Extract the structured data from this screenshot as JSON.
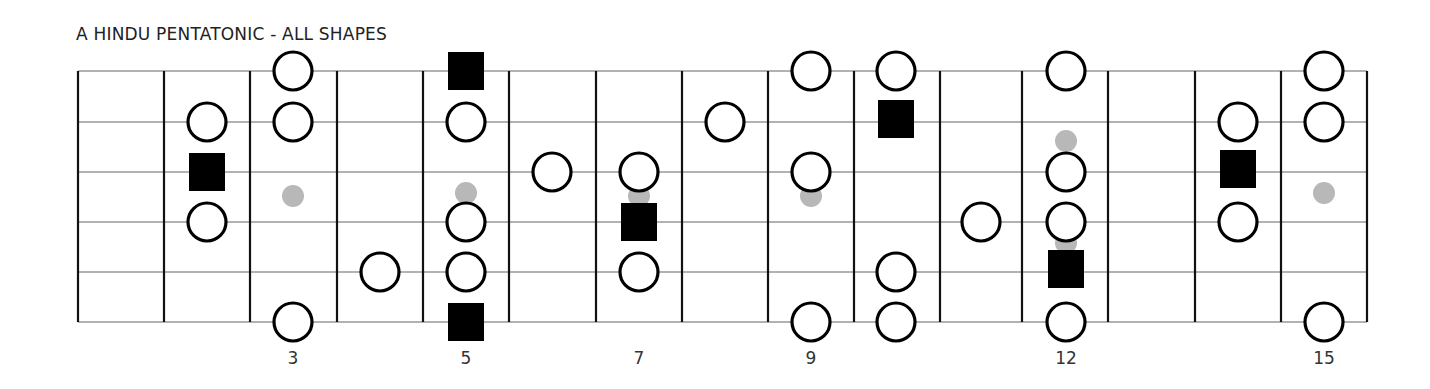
{
  "title": "A HINDU PENTATONIC - ALL SHAPES",
  "fretboard": {
    "fret_lines_x": [
      78,
      164,
      250,
      337,
      423,
      509,
      596,
      682,
      768,
      854,
      940,
      1022,
      1108,
      1195,
      1281,
      1367
    ],
    "strings_y": [
      71,
      122,
      172,
      222,
      272,
      322
    ],
    "string_color": "#999999",
    "fret_color": "#111111"
  },
  "fret_numbers": [
    {
      "label": "3",
      "x": 293
    },
    {
      "label": "5",
      "x": 466
    },
    {
      "label": "7",
      "x": 639
    },
    {
      "label": "9",
      "x": 811
    },
    {
      "label": "12",
      "x": 1066
    },
    {
      "label": "15",
      "x": 1324
    }
  ],
  "inlay_dots": [
    {
      "x": 293,
      "y": 196
    },
    {
      "x": 466,
      "y": 193
    },
    {
      "x": 639,
      "y": 196
    },
    {
      "x": 811,
      "y": 196
    },
    {
      "x": 1066,
      "y": 141
    },
    {
      "x": 1066,
      "y": 243
    },
    {
      "x": 1324,
      "y": 193
    }
  ],
  "notes": [
    {
      "type": "circle",
      "x": 207,
      "y": 122
    },
    {
      "type": "root",
      "x": 207,
      "y": 172
    },
    {
      "type": "circle",
      "x": 207,
      "y": 222
    },
    {
      "type": "circle",
      "x": 293,
      "y": 71
    },
    {
      "type": "circle",
      "x": 293,
      "y": 122
    },
    {
      "type": "circle",
      "x": 293,
      "y": 322
    },
    {
      "type": "circle",
      "x": 380,
      "y": 272
    },
    {
      "type": "root",
      "x": 466,
      "y": 71
    },
    {
      "type": "circle",
      "x": 466,
      "y": 122
    },
    {
      "type": "circle",
      "x": 466,
      "y": 222
    },
    {
      "type": "circle",
      "x": 466,
      "y": 272
    },
    {
      "type": "root",
      "x": 466,
      "y": 322
    },
    {
      "type": "circle",
      "x": 552,
      "y": 172
    },
    {
      "type": "circle",
      "x": 639,
      "y": 172
    },
    {
      "type": "root",
      "x": 639,
      "y": 222
    },
    {
      "type": "circle",
      "x": 639,
      "y": 272
    },
    {
      "type": "circle",
      "x": 725,
      "y": 122
    },
    {
      "type": "circle",
      "x": 811,
      "y": 71
    },
    {
      "type": "circle",
      "x": 811,
      "y": 172
    },
    {
      "type": "circle",
      "x": 811,
      "y": 322
    },
    {
      "type": "circle",
      "x": 896,
      "y": 71
    },
    {
      "type": "root",
      "x": 896,
      "y": 119
    },
    {
      "type": "circle",
      "x": 896,
      "y": 272
    },
    {
      "type": "circle",
      "x": 896,
      "y": 322
    },
    {
      "type": "circle",
      "x": 981,
      "y": 222
    },
    {
      "type": "circle",
      "x": 1066,
      "y": 71
    },
    {
      "type": "circle",
      "x": 1066,
      "y": 172
    },
    {
      "type": "circle",
      "x": 1066,
      "y": 222
    },
    {
      "type": "root",
      "x": 1066,
      "y": 269
    },
    {
      "type": "circle",
      "x": 1066,
      "y": 322
    },
    {
      "type": "circle",
      "x": 1238,
      "y": 122
    },
    {
      "type": "root",
      "x": 1238,
      "y": 169
    },
    {
      "type": "circle",
      "x": 1238,
      "y": 222
    },
    {
      "type": "circle",
      "x": 1324,
      "y": 71
    },
    {
      "type": "circle",
      "x": 1324,
      "y": 122
    },
    {
      "type": "circle",
      "x": 1324,
      "y": 322
    }
  ],
  "legend": {
    "circle": "scale tone",
    "root": "root note (A)",
    "inlay": "fret marker"
  }
}
